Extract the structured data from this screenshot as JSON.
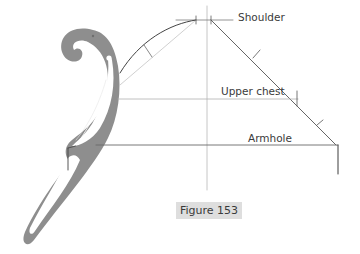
{
  "labels": {
    "shoulder": "Shoulder",
    "upper_chest": "Upper chest",
    "armhole": "Armhole"
  },
  "caption": "Figure 153",
  "colors": {
    "curve_ruler": "#8e8e8e",
    "line_dark": "#3c3c3c",
    "line_light": "#b0b0b0",
    "caption_bg": "#dedede"
  }
}
